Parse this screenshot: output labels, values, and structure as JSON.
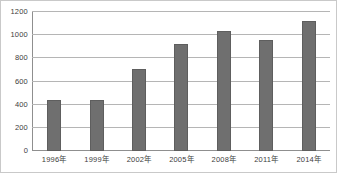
{
  "chart_data": {
    "type": "bar",
    "title": "",
    "subtitle": "",
    "xlabel": "",
    "ylabel": "",
    "categories": [
      "1996年",
      "1999年",
      "2002年",
      "2005年",
      "2008年",
      "2011年",
      "2014年"
    ],
    "values": [
      440,
      440,
      710,
      925,
      1040,
      960,
      1120
    ],
    "ylim": [
      0,
      1200
    ],
    "yticks": [
      0,
      200,
      400,
      600,
      800,
      1000,
      1200
    ],
    "ytick_labels": [
      "0",
      "200",
      "400",
      "600",
      "800",
      "1000",
      "1200"
    ],
    "grid": true,
    "legend": false,
    "legend_position": "none",
    "series": [
      {
        "name": "",
        "values": [
          440,
          440,
          710,
          925,
          1040,
          960,
          1120
        ]
      }
    ],
    "colors": {
      "bar": "#6f6f6f",
      "bar_border": "#5e5e5e",
      "gridline": "#b5b5b5",
      "axis": "#8f8f8f",
      "text": "#3d3d3d",
      "background": "#ffffff",
      "frame": "#c9c9c9"
    }
  }
}
